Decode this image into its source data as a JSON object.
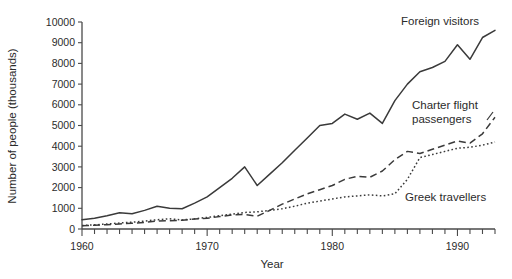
{
  "chart_data": {
    "type": "line",
    "title": "",
    "xlabel": "Year",
    "ylabel": "Number of people (thousands)",
    "xlim": [
      1960,
      1993
    ],
    "ylim": [
      0,
      10000
    ],
    "grid": false,
    "legend_position": "inline-annotations",
    "x_ticks_major": [
      1960,
      1970,
      1980,
      1990
    ],
    "x_tick_labels": [
      "1960",
      "1970",
      "1980",
      "1990"
    ],
    "y_ticks": [
      0,
      1000,
      2000,
      3000,
      4000,
      5000,
      6000,
      7000,
      8000,
      9000,
      10000
    ],
    "y_tick_labels": [
      "0",
      "1000",
      "2000",
      "3000",
      "4000",
      "5000",
      "6000",
      "7000",
      "8000",
      "9000",
      "10000"
    ],
    "x": [
      1960,
      1961,
      1962,
      1963,
      1964,
      1965,
      1966,
      1967,
      1968,
      1969,
      1970,
      1971,
      1972,
      1973,
      1974,
      1975,
      1976,
      1977,
      1978,
      1979,
      1980,
      1981,
      1982,
      1983,
      1984,
      1985,
      1986,
      1987,
      1988,
      1989,
      1990,
      1991,
      1992,
      1993
    ],
    "series": [
      {
        "name": "Foreign visitors",
        "style": "solid",
        "label_text": "Foreign visitors",
        "values": [
          450,
          520,
          640,
          780,
          740,
          900,
          1100,
          1000,
          980,
          1250,
          1550,
          2000,
          2450,
          3000,
          2100,
          2650,
          3200,
          3800,
          4400,
          5000,
          5100,
          5550,
          5300,
          5600,
          5100,
          6200,
          7000,
          7600,
          7800,
          8100,
          8900,
          8200,
          9250,
          9600
        ]
      },
      {
        "name": "Charter flight passengers",
        "style": "dashed",
        "label_text": "Charter flight passengers",
        "values": [
          160,
          180,
          210,
          240,
          280,
          320,
          380,
          400,
          420,
          480,
          520,
          600,
          680,
          700,
          620,
          900,
          1200,
          1450,
          1700,
          1900,
          2100,
          2400,
          2550,
          2500,
          2800,
          3350,
          3750,
          3650,
          3850,
          4050,
          4250,
          4150,
          4600,
          5400
        ]
      },
      {
        "name": "Greek travellers",
        "style": "dotted",
        "label_text": "Greek travellers",
        "values": [
          170,
          200,
          240,
          290,
          330,
          380,
          450,
          490,
          440,
          490,
          560,
          640,
          720,
          800,
          830,
          900,
          980,
          1100,
          1250,
          1350,
          1450,
          1550,
          1600,
          1650,
          1600,
          1700,
          2400,
          3450,
          3600,
          3750,
          3900,
          3950,
          4050,
          4200
        ]
      }
    ],
    "annotations": [
      {
        "text": "Foreign visitors",
        "near_year": 1988
      },
      {
        "text": "Charter flight",
        "near_year": 1987
      },
      {
        "text": "passengers",
        "near_year": 1987
      },
      {
        "text": "Greek travellers",
        "near_year": 1989
      }
    ]
  }
}
